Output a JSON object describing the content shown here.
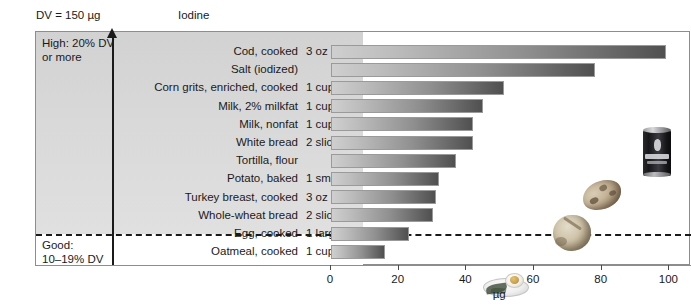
{
  "header": {
    "dv_text": "DV = 150 µg",
    "nutrient": "Iodine"
  },
  "zones": {
    "high": "High: 20% DV\nor more",
    "good": "Good:\n10–19% DV"
  },
  "axis": {
    "xlabel": "µg",
    "ticks": [
      "0",
      "20",
      "40",
      "60",
      "80",
      "100"
    ]
  },
  "photos": {
    "salt": "salt-canister-photo",
    "tortilla": "tortilla-photo",
    "potato": "baked-potato-photo",
    "egg": "egg-on-plate-photo"
  },
  "chart_data": {
    "type": "bar",
    "orientation": "horizontal",
    "title": "Iodine",
    "subtitle": "DV = 150 µg",
    "xlabel": "µg",
    "ylabel": "",
    "xlim": [
      0,
      105
    ],
    "xticks": [
      0,
      20,
      40,
      60,
      80,
      100
    ],
    "grid": false,
    "legend": false,
    "categories": [
      "Cod, cooked",
      "Salt (iodized)",
      "Corn grits, enriched, cooked",
      "Milk, 2% milkfat",
      "Milk, nonfat",
      "White bread",
      "Tortilla, flour",
      "Potato, baked",
      "Turkey breast, cooked",
      "Whole-wheat bread",
      "Egg, cooked",
      "Oatmeal, cooked"
    ],
    "amounts": [
      "3 oz",
      "",
      "1 cup",
      "1 cup",
      "1 cup",
      "2 slices",
      "",
      "1 small",
      "3 oz",
      "2 slices",
      "1 large",
      "1 cup"
    ],
    "values": [
      99,
      78,
      51,
      45,
      42,
      42,
      37,
      32,
      31,
      30,
      23,
      16
    ],
    "zone_of": [
      "high",
      "high",
      "high",
      "high",
      "high",
      "high",
      "high",
      "high",
      "high",
      "high",
      "good",
      "good"
    ],
    "zone_threshold_label": "20% DV",
    "colors": {
      "bar_gradient_start": "#cfcfcf",
      "bar_gradient_end": "#505050",
      "bar_border": "#9a9a9a",
      "band_high": "#d8d8d8",
      "band_good": "#ffffff",
      "frame_border": "#8d8d8d",
      "text": "#1a1a1a"
    }
  }
}
